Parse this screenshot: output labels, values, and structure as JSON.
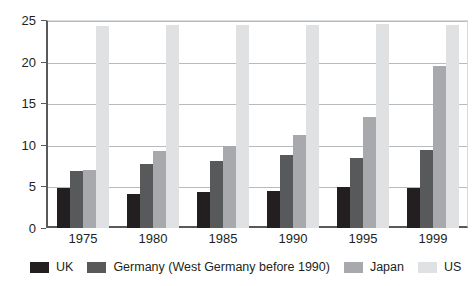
{
  "chart_data": {
    "type": "bar",
    "title": "",
    "xlabel": "",
    "ylabel": "",
    "ylim": [
      0,
      25
    ],
    "yticks": [
      0,
      5,
      10,
      15,
      20,
      25
    ],
    "ytick_labels": [
      "0",
      "5",
      "10",
      "15",
      "20",
      "25"
    ],
    "grid": true,
    "legend_position": "bottom",
    "categories": [
      "1975",
      "1980",
      "1985",
      "1990",
      "1995",
      "1999"
    ],
    "series": [
      {
        "name": "UK",
        "color": "#231f20",
        "values": [
          4.8,
          4.1,
          4.3,
          4.5,
          4.9,
          4.8
        ]
      },
      {
        "name": "Germany (West Germany before 1990)",
        "color": "#58595b",
        "values": [
          6.8,
          7.7,
          8.0,
          8.8,
          8.4,
          9.4
        ]
      },
      {
        "name": "Japan",
        "color": "#a7a9ac",
        "values": [
          7.0,
          9.2,
          9.9,
          11.2,
          13.4,
          19.5
        ]
      },
      {
        "name": "US",
        "color": "#e0e1e2",
        "values": [
          24.3,
          24.4,
          24.4,
          24.4,
          24.5,
          24.4
        ]
      }
    ]
  }
}
